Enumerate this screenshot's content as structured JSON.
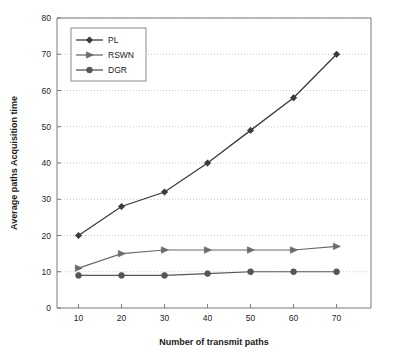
{
  "chart_data": {
    "type": "line",
    "title": "",
    "xlabel": "Number of transmit paths",
    "ylabel": "Average paths Acquisition time",
    "x": [
      10,
      20,
      30,
      40,
      50,
      60,
      70
    ],
    "xlim": [
      5,
      78
    ],
    "ylim": [
      0,
      80
    ],
    "xticks": [
      10,
      20,
      30,
      40,
      50,
      60,
      70
    ],
    "yticks": [
      0,
      10,
      20,
      30,
      40,
      50,
      60,
      70,
      80
    ],
    "xtick_labels": [
      "10",
      "20",
      "30",
      "40",
      "50",
      "60",
      "70"
    ],
    "ytick_labels": [
      "0",
      "10",
      "20",
      "30",
      "40",
      "50",
      "60",
      "70",
      "80"
    ],
    "grid": "horizontal-dotted",
    "legend_position": "upper-left-inside",
    "series": [
      {
        "name": "PL",
        "marker": "diamond",
        "color": "#3b3b3b",
        "values": [
          20,
          28,
          32,
          40,
          49,
          58,
          70
        ]
      },
      {
        "name": "RSWN",
        "marker": "right-triangle",
        "color": "#6b6b6b",
        "values": [
          11,
          15,
          16,
          16,
          16,
          16,
          17
        ]
      },
      {
        "name": "DGR",
        "marker": "circle",
        "color": "#555555",
        "values": [
          9,
          9,
          9,
          9.5,
          10,
          10,
          10
        ]
      }
    ]
  },
  "legend": {
    "entries": [
      {
        "label": "PL"
      },
      {
        "label": "RSWN"
      },
      {
        "label": "DGR"
      }
    ]
  },
  "axes": {
    "x_title": "Number of transmit paths",
    "y_title": "Average paths Acquisition time"
  }
}
